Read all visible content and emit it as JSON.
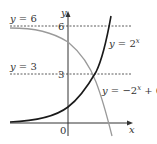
{
  "figure": {
    "type": "function-graph",
    "axes": {
      "x_label": "x",
      "y_label": "y",
      "origin_label": "0"
    },
    "y_ticks": [
      {
        "value": 6,
        "label": "6"
      },
      {
        "value": 3,
        "label": "3"
      }
    ],
    "asymptote_labels": {
      "y6": "y = 6",
      "y3": "y = 3"
    },
    "curves": [
      {
        "name": "exp",
        "label": "y = 2",
        "exponent": "x",
        "color": "#222222"
      },
      {
        "name": "reflected",
        "label_prefix": "y = −2",
        "exponent": "x",
        "label_suffix": " + 6",
        "color": "#999999"
      }
    ]
  }
}
